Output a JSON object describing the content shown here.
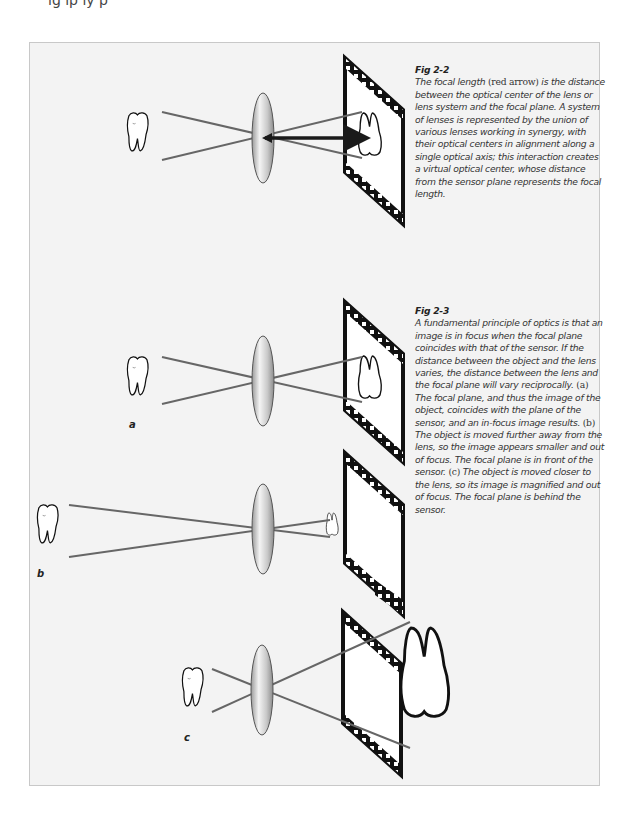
{
  "page": {
    "top_fragment": "ıg ıp ıy p"
  },
  "figures": [
    {
      "id": "fig-2-2",
      "label": "Fig 2-2",
      "caption_parts": {
        "a": "The focal length ",
        "b": "(red arrow)",
        "c": " is the distance between the optical center of the lens or lens system and the focal plane. A system of lenses is represented by the union of various lenses working in synergy, with their optical centers in alignment along a single optical axis; this interaction creates a virtual optical center, whose distance from the sensor plane represents the focal length."
      },
      "arrow_color": "#1a1a1a"
    },
    {
      "id": "fig-2-3",
      "label": "Fig 2-3",
      "caption_parts": {
        "intro": "A fundamental principle of optics is that an image is in focus when the focal plane coincides with that of the sensor. If the distance between the object and the lens varies, the distance between the lens and the focal plane will vary reciprocally. ",
        "a_mark": "(a)",
        "a_text": " The focal plane, and thus the image of the object, coincides with the plane of the sensor, and an in-focus image results. ",
        "b_mark": "(b)",
        "b_text": " The object is moved further away from the lens, so the image appears smaller and out of focus. The focal plane is in front of the sensor. ",
        "c_mark": "(c)",
        "c_text": " The object is moved closer to the lens, so its image is magnified and out of focus. The focal plane is behind the sensor."
      },
      "panels": [
        {
          "label": "a"
        },
        {
          "label": "b"
        },
        {
          "label": "c"
        }
      ]
    }
  ],
  "colors": {
    "panel_bg": "#f3f3f3",
    "panel_border": "#c8c8c8",
    "ray": "#666666",
    "lens_fill": "#cfcfcf"
  }
}
